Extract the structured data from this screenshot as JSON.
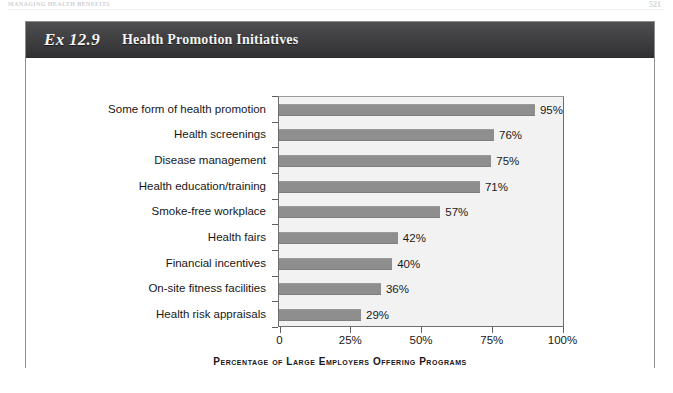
{
  "page": {
    "running_head": "MANAGING HEALTH BENEFITS",
    "folio": "521"
  },
  "exhibit": {
    "number_label": "Ex 12.9",
    "title": "Health Promotion Initiatives"
  },
  "colors": {
    "title_bar": "#434345",
    "bar_fill": "#8e8e8e",
    "plot_background": "#f2f2f2",
    "axis_line": "#6e6e70",
    "text": "#17171a"
  },
  "chart_data": {
    "type": "bar",
    "orientation": "horizontal",
    "title": "Health Promotion Initiatives",
    "xlabel": "Percentage of Large Employers Offering Programs",
    "ylabel": "",
    "xlim": [
      0,
      100
    ],
    "grid": false,
    "legend": "none",
    "xticklabels": [
      "0",
      "25%",
      "50%",
      "75%",
      "100%"
    ],
    "xtickvalues": [
      0,
      25,
      50,
      75,
      100
    ],
    "categories": [
      "Some form of health promotion",
      "Health screenings",
      "Disease management",
      "Health education/training",
      "Smoke-free workplace",
      "Health fairs",
      "Financial incentives",
      "On-site fitness facilities",
      "Health risk appraisals"
    ],
    "values": [
      95,
      76,
      75,
      71,
      57,
      42,
      40,
      36,
      29
    ],
    "value_labels": [
      "95%",
      "76%",
      "75%",
      "71%",
      "57%",
      "42%",
      "40%",
      "36%",
      "29%"
    ]
  }
}
